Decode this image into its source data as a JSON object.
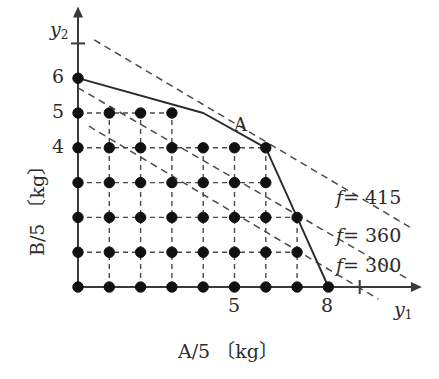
{
  "figure": {
    "axes": {
      "x": {
        "name": "y",
        "subscript": "1",
        "unit_label": "A/5 〔kg〕",
        "tick_labels": [
          "5",
          "8"
        ],
        "tick_values": [
          5,
          8
        ],
        "extra_tick_value": 9,
        "range": [
          0,
          10.7
        ]
      },
      "y": {
        "name": "y",
        "subscript": "2",
        "unit_label": "B/5 〔kg〕",
        "tick_labels": [
          "6",
          "5",
          "4"
        ],
        "tick_values": [
          6,
          5,
          4
        ],
        "extra_tick_value": 7,
        "range": [
          0,
          7.8
        ]
      }
    },
    "point_labels": [
      {
        "text": "A",
        "x": 6,
        "y": 4
      }
    ],
    "objective_lines": [
      {
        "label": "f = 415",
        "label_text_italic": "f",
        "label_text_rest": "= 415",
        "value": 415
      },
      {
        "label": "f = 360",
        "label_text_italic": "f",
        "label_text_rest": "= 360",
        "value": 360
      },
      {
        "label": "f = 300",
        "label_text_italic": "f",
        "label_text_rest": "= 300",
        "value": 300
      }
    ],
    "colors": {
      "axis": "#3a3a3a",
      "solid_boundary": "#2a2a2a",
      "dashed": "#4a4a4a",
      "dot_fill": "#111111",
      "text": "#2b2b2b",
      "background": "#ffffff"
    }
  },
  "chart_data": {
    "type": "scatter",
    "title": "",
    "xlabel": "A/5 〔kg〕",
    "ylabel": "B/5 〔kg〕",
    "xlim": [
      0,
      10.7
    ],
    "ylim": [
      0,
      7.8
    ],
    "grid": true,
    "legend_position": "right",
    "x_axis_variable": "y1",
    "y_axis_variable": "y2",
    "x_tick_labels": [
      "5",
      "8"
    ],
    "x_tick_values": [
      5,
      8
    ],
    "y_tick_labels": [
      "4",
      "5",
      "6"
    ],
    "y_tick_values": [
      4,
      5,
      6
    ],
    "feasible_boundary": {
      "name": "feasible region boundary",
      "style": "solid",
      "vertices": [
        [
          0,
          6
        ],
        [
          4,
          5
        ],
        [
          6,
          4
        ],
        [
          7,
          2
        ],
        [
          8,
          0
        ]
      ]
    },
    "lattice_points": [
      [
        0,
        0
      ],
      [
        1,
        0
      ],
      [
        2,
        0
      ],
      [
        3,
        0
      ],
      [
        4,
        0
      ],
      [
        5,
        0
      ],
      [
        6,
        0
      ],
      [
        7,
        0
      ],
      [
        8,
        0
      ],
      [
        0,
        1
      ],
      [
        1,
        1
      ],
      [
        2,
        1
      ],
      [
        3,
        1
      ],
      [
        4,
        1
      ],
      [
        5,
        1
      ],
      [
        6,
        1
      ],
      [
        7,
        1
      ],
      [
        0,
        2
      ],
      [
        1,
        2
      ],
      [
        2,
        2
      ],
      [
        3,
        2
      ],
      [
        4,
        2
      ],
      [
        5,
        2
      ],
      [
        6,
        2
      ],
      [
        7,
        2
      ],
      [
        0,
        3
      ],
      [
        1,
        3
      ],
      [
        2,
        3
      ],
      [
        3,
        3
      ],
      [
        4,
        3
      ],
      [
        5,
        3
      ],
      [
        6,
        3
      ],
      [
        0,
        4
      ],
      [
        1,
        4
      ],
      [
        2,
        4
      ],
      [
        3,
        4
      ],
      [
        4,
        4
      ],
      [
        5,
        4
      ],
      [
        6,
        4
      ],
      [
        0,
        5
      ],
      [
        1,
        5
      ],
      [
        2,
        5
      ],
      [
        3,
        5
      ],
      [
        0,
        6
      ]
    ],
    "series": [
      {
        "name": "f = 300",
        "type": "line",
        "style": "dashed",
        "value": 300,
        "endpoints": [
          [
            0.35,
            4.62
          ],
          [
            9.6,
            -0.35
          ]
        ]
      },
      {
        "name": "f = 360",
        "type": "line",
        "style": "dashed",
        "value": 360,
        "endpoints": [
          [
            0.0,
            5.72
          ],
          [
            10.5,
            0.25
          ]
        ]
      },
      {
        "name": "f = 415",
        "type": "line",
        "style": "dashed",
        "value": 415,
        "endpoints": [
          [
            0.52,
            7.1
          ],
          [
            10.6,
            1.72
          ]
        ]
      }
    ],
    "annotations": [
      {
        "text": "A",
        "x": 6,
        "y": 4,
        "note": "optimal integer solution"
      }
    ]
  }
}
